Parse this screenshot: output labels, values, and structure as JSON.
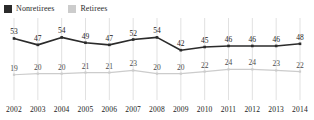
{
  "legend": {
    "position": "top-left",
    "items": [
      {
        "label": "Nonretirees",
        "color": "#2b2b2b",
        "marker": "square"
      },
      {
        "label": "Retirees",
        "color": "#cccccc",
        "marker": "square"
      }
    ]
  },
  "chart_data": {
    "type": "line",
    "title": "",
    "subtitle": "",
    "xlabel": "",
    "ylabel": "",
    "grid": "vertical",
    "legend_position": "top-left",
    "ylim": [
      0,
      60
    ],
    "categories": [
      "2002",
      "2003",
      "2004",
      "2005",
      "2006",
      "2007",
      "2008",
      "2009",
      "2010",
      "2011",
      "2012",
      "2013",
      "2014"
    ],
    "series": [
      {
        "name": "Nonretirees",
        "color": "#2b2b2b",
        "values": [
          53,
          47,
          54,
          49,
          47,
          52,
          54,
          42,
          45,
          46,
          46,
          46,
          48
        ]
      },
      {
        "name": "Retirees",
        "color": "#cccccc",
        "values": [
          19,
          20,
          20,
          21,
          21,
          23,
          20,
          20,
          22,
          24,
          24,
          23,
          22
        ]
      }
    ]
  },
  "axis": {
    "tick_labels": [
      "2002",
      "2003",
      "2004",
      "2005",
      "2006",
      "2007",
      "2008",
      "2009",
      "2010",
      "2011",
      "2012",
      "2013",
      "2014"
    ]
  },
  "colors": {
    "gridline": "#d9d9d9",
    "dark_series": "#2b2b2b",
    "light_series": "#cccccc",
    "text": "#1a1a1a",
    "background": "#ffffff"
  }
}
